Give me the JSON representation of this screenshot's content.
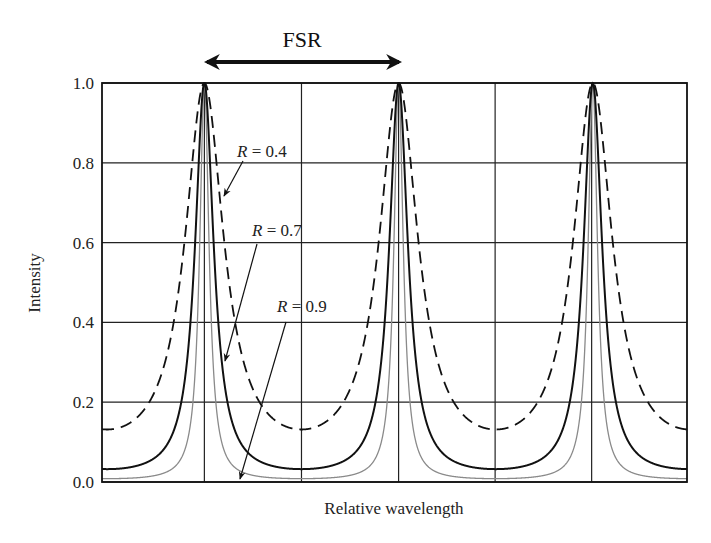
{
  "chart_data": {
    "type": "line",
    "title": "FSR",
    "xlabel": "Relative wavelength",
    "ylabel": "Intensity",
    "ylim": [
      0.0,
      1.0
    ],
    "yticks": [
      "0.0",
      "0.2",
      "0.4",
      "0.6",
      "0.8",
      "1.0"
    ],
    "xticks": [],
    "grid": true,
    "legend": "inline annotations with arrows",
    "peak_positions_relative": [
      0.175,
      0.507,
      0.837
    ],
    "period_relative": 0.332,
    "series": [
      {
        "name": "R = 0.4",
        "style": "dashed",
        "color": "#111111",
        "coefficient_F": 6.6,
        "min_intensity": 0.13,
        "max_intensity": 1.0
      },
      {
        "name": "R = 0.7",
        "style": "solid",
        "color": "#111111",
        "coefficient_F": 30,
        "min_intensity": 0.03,
        "max_intensity": 1.0
      },
      {
        "name": "R = 0.9",
        "style": "solid-thin",
        "color": "#8a8a8a",
        "coefficient_F": 118,
        "min_intensity": 0.008,
        "max_intensity": 1.0
      }
    ],
    "annotations": [
      {
        "text_var": "R",
        "text_val": " = 0.4"
      },
      {
        "text_var": "R",
        "text_val": " = 0.7"
      },
      {
        "text_var": "R",
        "text_val": " = 0.9"
      },
      {
        "text": "FSR",
        "type": "double-arrow between adjacent peaks"
      }
    ]
  }
}
